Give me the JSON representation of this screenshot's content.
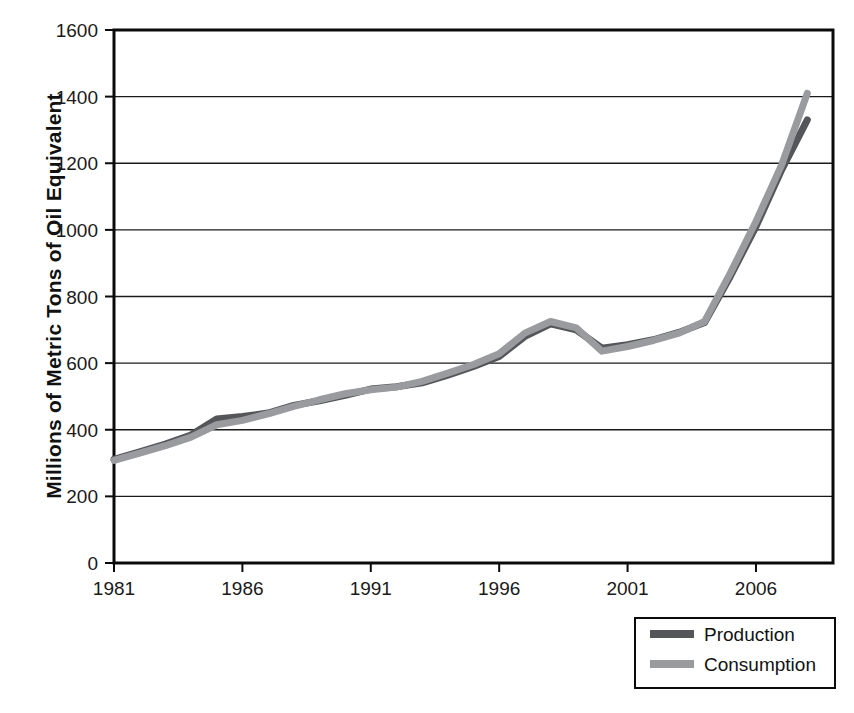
{
  "chart_data": {
    "type": "line",
    "title": "",
    "xlabel": "",
    "ylabel": "Millions of Metric Tons of Oil Equivalent",
    "xlim": [
      1981,
      2009
    ],
    "ylim": [
      0,
      1600
    ],
    "grid": true,
    "legend_position": "bottom-right",
    "x_ticks": [
      "1981",
      "1986",
      "1991",
      "1996",
      "2001",
      "2006"
    ],
    "x_tick_values": [
      1981,
      1986,
      1991,
      1996,
      2001,
      2006
    ],
    "y_ticks": [
      "0",
      "200",
      "400",
      "600",
      "800",
      "1000",
      "1200",
      "1400",
      "1600"
    ],
    "y_tick_values": [
      0,
      200,
      400,
      600,
      800,
      1000,
      1200,
      1400,
      1600
    ],
    "x": [
      1981,
      1982,
      1983,
      1984,
      1985,
      1986,
      1987,
      1988,
      1989,
      1990,
      1991,
      1992,
      1993,
      1994,
      1995,
      1996,
      1997,
      1998,
      1999,
      2000,
      2001,
      2002,
      2003,
      2004,
      2005,
      2006,
      2007,
      2008
    ],
    "series": [
      {
        "name": "Production",
        "color": "#55565a",
        "values": [
          311,
          334,
          357,
          384,
          432,
          440,
          450,
          473,
          487,
          503,
          522,
          529,
          541,
          564,
          590,
          620,
          680,
          718,
          700,
          645,
          655,
          670,
          692,
          722,
          860,
          1010,
          1180,
          1330
        ]
      },
      {
        "name": "Consumption",
        "color": "#9a9b9f",
        "values": [
          308,
          330,
          352,
          378,
          415,
          428,
          448,
          470,
          490,
          508,
          520,
          528,
          545,
          570,
          596,
          628,
          690,
          725,
          706,
          636,
          650,
          668,
          690,
          725,
          870,
          1025,
          1195,
          1410
        ]
      }
    ]
  },
  "axis": {
    "y_title": "Millions of Metric Tons of Oil Equivalent"
  },
  "legend": {
    "items": [
      {
        "label": "Production",
        "color": "#55565a"
      },
      {
        "label": "Consumption",
        "color": "#9a9b9f"
      }
    ]
  }
}
